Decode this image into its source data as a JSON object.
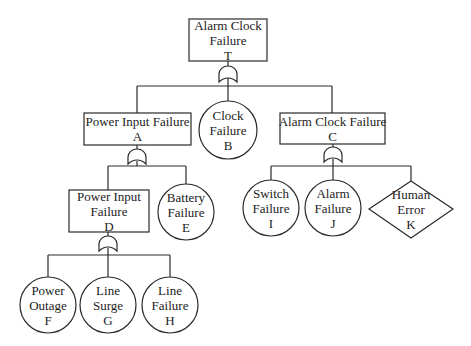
{
  "diagram": {
    "type": "fault-tree",
    "nodes": {
      "T": {
        "label": "Alarm Clock\nFailure\nT",
        "shape": "rectangle",
        "kind": "top-event"
      },
      "A": {
        "label": "Power Input Failure\nA",
        "shape": "rectangle",
        "kind": "intermediate-event"
      },
      "B": {
        "label": "Clock\nFailure\nB",
        "shape": "circle",
        "kind": "basic-event"
      },
      "C": {
        "label": "Alarm Clock Failure\nC",
        "shape": "rectangle",
        "kind": "intermediate-event"
      },
      "D": {
        "label": "Power Input\nFailure\nD",
        "shape": "rectangle",
        "kind": "intermediate-event"
      },
      "E": {
        "label": "Battery\nFailure\nE",
        "shape": "circle",
        "kind": "basic-event"
      },
      "F": {
        "label": "Power\nOutage\nF",
        "shape": "circle",
        "kind": "basic-event"
      },
      "G": {
        "label": "Line\nSurge\nG",
        "shape": "circle",
        "kind": "basic-event"
      },
      "H": {
        "label": "Line\nFailure\nH",
        "shape": "circle",
        "kind": "basic-event"
      },
      "I": {
        "label": "Switch\nFailure\nI",
        "shape": "circle",
        "kind": "basic-event"
      },
      "J": {
        "label": "Alarm\nFailure\nJ",
        "shape": "circle",
        "kind": "basic-event"
      },
      "K": {
        "label": "Human\nError\nK",
        "shape": "diamond",
        "kind": "undeveloped-event"
      }
    },
    "gates": [
      {
        "parent": "T",
        "type": "AND",
        "children": [
          "A",
          "B",
          "C"
        ]
      },
      {
        "parent": "A",
        "type": "AND",
        "children": [
          "D",
          "E"
        ]
      },
      {
        "parent": "C",
        "type": "AND",
        "children": [
          "I",
          "J",
          "K"
        ]
      },
      {
        "parent": "D",
        "type": "AND",
        "children": [
          "F",
          "G",
          "H"
        ]
      }
    ],
    "colors": {
      "stroke": "#2a2a2a",
      "fill": "#ffffff",
      "text": "#222222"
    }
  }
}
